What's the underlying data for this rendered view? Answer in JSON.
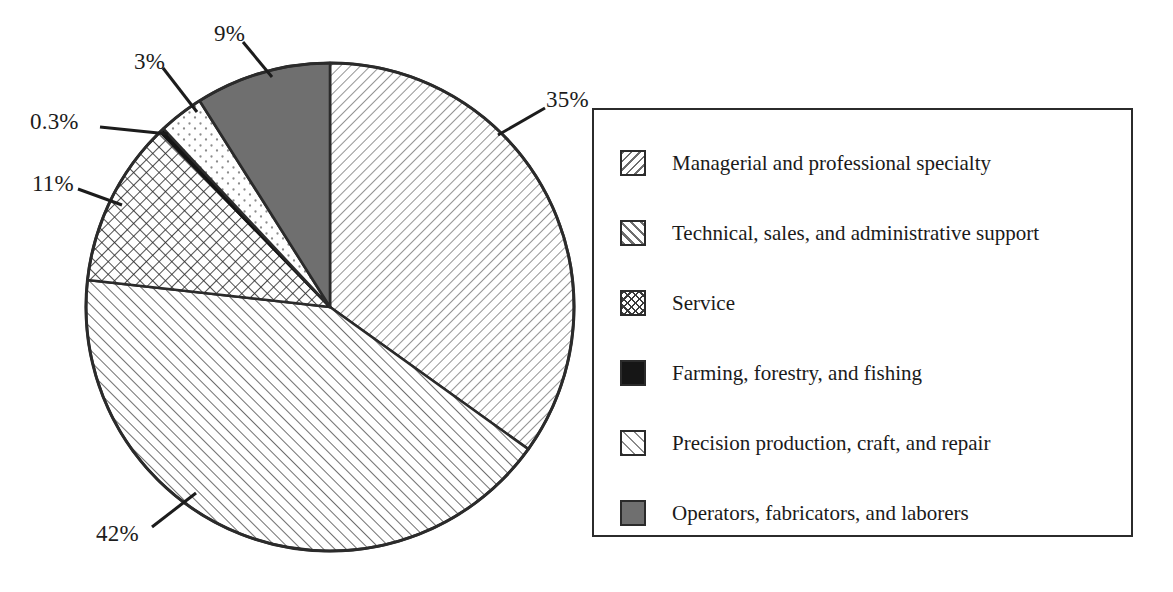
{
  "chart_data": {
    "type": "pie",
    "title": "",
    "xlabel": "",
    "ylabel": "",
    "legend_position": "right",
    "grid": false,
    "categories": [
      "Managerial and professional specialty",
      "Technical, sales, and administrative support",
      "Service",
      "Farming, forestry, and fishing",
      "Precision production, craft, and repair",
      "Operators, fabricators, and laborers"
    ],
    "values": [
      35,
      42,
      11,
      0.3,
      3,
      9
    ],
    "value_labels": [
      "35%",
      "42%",
      "11%",
      "0.3%",
      "3%",
      "9%"
    ],
    "slice_patterns": [
      "backslash-hatch",
      "forwardslash-hatch",
      "cross-hatch",
      "solid-black",
      "sparse-dots",
      "solid-gray"
    ],
    "slice_order_clockwise_from_top": [
      "Managerial and professional specialty",
      "Technical, sales, and administrative support",
      "Service",
      "Farming, forestry, and fishing",
      "Precision production, craft, and repair",
      "Operators, fabricators, and laborers"
    ]
  },
  "pie": {
    "labels": [
      {
        "id": "pct-35",
        "text": "35%"
      },
      {
        "id": "pct-42",
        "text": "42%"
      },
      {
        "id": "pct-11",
        "text": "11%"
      },
      {
        "id": "pct-03",
        "text": "0.3%"
      },
      {
        "id": "pct-3",
        "text": "3%"
      },
      {
        "id": "pct-9",
        "text": "9%"
      }
    ]
  },
  "legend": {
    "items": [
      {
        "label": "Managerial and professional specialty",
        "pattern": "backslash-hatch"
      },
      {
        "label": "Technical, sales, and administrative support",
        "pattern": "forwardslash-hatch"
      },
      {
        "label": "Service",
        "pattern": "cross-hatch"
      },
      {
        "label": "Farming, forestry, and fishing",
        "pattern": "solid-black"
      },
      {
        "label": "Precision production, craft, and repair",
        "pattern": "sparse-dots"
      },
      {
        "label": "Operators, fabricators, and laborers",
        "pattern": "solid-gray"
      }
    ]
  },
  "colors": {
    "outline": "#2b2b2b",
    "hatch_line": "#6d6d6d",
    "crosshatch_line": "#3a3a3a",
    "solid_black": "#161616",
    "solid_gray": "#6f6f6f",
    "dot": "#8a8a8a",
    "background": "#ffffff",
    "text": "#1a1a1a"
  }
}
